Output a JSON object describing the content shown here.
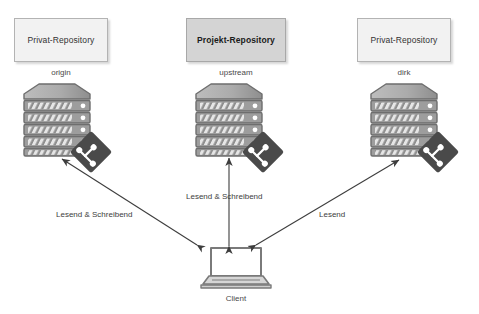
{
  "diagram": {
    "colors": {
      "box_fill": "#f2f2f2",
      "box_fill_accent": "#d4d4d4",
      "box_border": "#b3b3b3",
      "server_body": "#9d9d9d",
      "server_light": "#d9d9d9",
      "git_badge": "#4a4a4a",
      "arrow": "#3d3d3d",
      "text": "#333333",
      "background": "#ffffff"
    }
  },
  "nodes": {
    "origin": {
      "box_label": "Privat-Repository",
      "caption": "origin",
      "icon": "server-stack-icon",
      "badge_icon": "git-logo-icon",
      "accent": false
    },
    "upstream": {
      "box_label": "Projekt-Repository",
      "caption": "upstream",
      "icon": "server-stack-icon",
      "badge_icon": "git-logo-icon",
      "accent": true
    },
    "dirk": {
      "box_label": "Privat-Repository",
      "caption": "dirk",
      "icon": "server-stack-icon",
      "badge_icon": "git-logo-icon",
      "accent": false
    },
    "client": {
      "caption": "Client",
      "icon": "laptop-icon"
    }
  },
  "edges": [
    {
      "id": "client-origin",
      "from": "client",
      "to": "origin",
      "label": "Lesend & Schreibend",
      "arrowheads": "both"
    },
    {
      "id": "client-upstream",
      "from": "client",
      "to": "upstream",
      "label": "Lesend & Schreibend",
      "arrowheads": "both"
    },
    {
      "id": "client-dirk",
      "from": "dirk",
      "to": "client",
      "label": "Lesend",
      "arrowheads": "both"
    }
  ]
}
